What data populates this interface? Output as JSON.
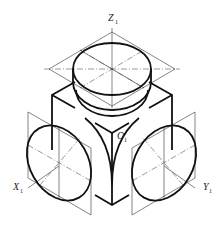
{
  "figure": {
    "axes": {
      "z": {
        "letter": "Z",
        "subscript": "1"
      },
      "x": {
        "letter": "X",
        "subscript": "1"
      },
      "y": {
        "letter": "Y",
        "subscript": "1"
      },
      "origin": {
        "letter": "O",
        "subscript": "1"
      }
    },
    "elements": [
      "cube",
      "top-ellipse",
      "left-ellipse",
      "right-ellipse",
      "rhombus-constructions",
      "center-lines"
    ]
  }
}
